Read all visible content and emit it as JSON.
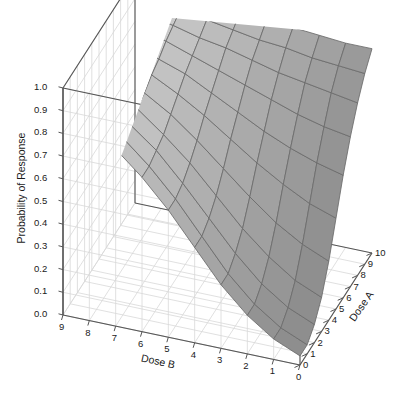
{
  "chart_data": {
    "type": "surface",
    "title": "",
    "xlabel": "Dose B",
    "ylabel": "Dose A",
    "zlabel": "Probability of Response",
    "grid": true,
    "legend": "none",
    "projection": "3d",
    "xlim": [
      0,
      9
    ],
    "ylim": [
      0,
      10
    ],
    "zlim": [
      0.0,
      1.0
    ],
    "x_ticks": [
      "9",
      "8",
      "7",
      "6",
      "5",
      "4",
      "3",
      "2",
      "1",
      "0"
    ],
    "x_tick_values": [
      9,
      8,
      7,
      6,
      5,
      4,
      3,
      2,
      1,
      0
    ],
    "y_ticks": [
      "0",
      "1",
      "2",
      "3",
      "4",
      "5",
      "6",
      "7",
      "8",
      "9",
      "10"
    ],
    "y_tick_values": [
      0,
      1,
      2,
      3,
      4,
      5,
      6,
      7,
      8,
      9,
      10
    ],
    "z_ticks": [
      "0.0",
      "0.1",
      "0.2",
      "0.3",
      "0.4",
      "0.5",
      "0.6",
      "0.7",
      "0.8",
      "0.9",
      "1.0"
    ],
    "z_tick_values": [
      0.0,
      0.1,
      0.2,
      0.3,
      0.4,
      0.5,
      0.6,
      0.7,
      0.8,
      0.9,
      1.0
    ],
    "x_grid_values": [
      0,
      1,
      2,
      3,
      4,
      5,
      6,
      7,
      8,
      9
    ],
    "y_grid_values": [
      0,
      1,
      2,
      3,
      4,
      5,
      6,
      7,
      8,
      9,
      10
    ],
    "surface_rows_doseB": [
      9,
      8,
      7,
      6,
      5,
      4,
      3,
      2,
      1,
      0
    ],
    "surface_cols_doseA": [
      0,
      1,
      2,
      3,
      4,
      5,
      6,
      7,
      8,
      9,
      10
    ],
    "surface_z": [
      [
        0.9,
        0.9,
        0.91,
        0.92,
        0.93,
        0.94,
        0.95,
        0.96,
        0.97,
        0.98,
        0.99
      ],
      [
        0.85,
        0.85,
        0.86,
        0.87,
        0.89,
        0.9,
        0.92,
        0.94,
        0.95,
        0.97,
        0.98
      ],
      [
        0.78,
        0.78,
        0.79,
        0.81,
        0.83,
        0.86,
        0.88,
        0.91,
        0.93,
        0.95,
        0.97
      ],
      [
        0.68,
        0.68,
        0.7,
        0.72,
        0.76,
        0.8,
        0.84,
        0.87,
        0.9,
        0.93,
        0.96
      ],
      [
        0.56,
        0.56,
        0.58,
        0.62,
        0.67,
        0.73,
        0.78,
        0.83,
        0.88,
        0.91,
        0.94
      ],
      [
        0.42,
        0.42,
        0.45,
        0.5,
        0.57,
        0.65,
        0.72,
        0.79,
        0.85,
        0.89,
        0.93
      ],
      [
        0.28,
        0.28,
        0.32,
        0.38,
        0.47,
        0.57,
        0.66,
        0.75,
        0.82,
        0.88,
        0.92
      ],
      [
        0.17,
        0.17,
        0.21,
        0.28,
        0.38,
        0.5,
        0.61,
        0.71,
        0.8,
        0.86,
        0.91
      ],
      [
        0.09,
        0.09,
        0.13,
        0.2,
        0.31,
        0.44,
        0.57,
        0.68,
        0.78,
        0.85,
        0.9
      ],
      [
        0.04,
        0.04,
        0.08,
        0.15,
        0.26,
        0.4,
        0.54,
        0.66,
        0.76,
        0.84,
        0.9
      ]
    ],
    "colors": {
      "surface_light": "#d6d6d6",
      "surface_dark": "#8e8e8e",
      "mesh_line": "#6b6b6b",
      "axis_line": "#555555",
      "grid_line": "#d8d8d8",
      "text": "#1a1a1a",
      "background": "#ffffff"
    }
  },
  "axes": {
    "z_title": "Probability of Response",
    "x_title": "Dose B",
    "y_title": "Dose A"
  }
}
